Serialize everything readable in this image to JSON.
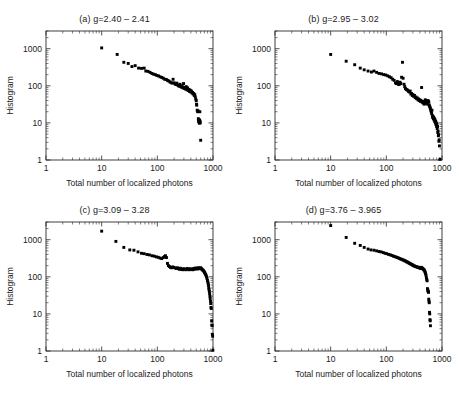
{
  "figure": {
    "cut_top_text": "",
    "background": "#ffffff",
    "marker_color": "#000000",
    "axis_color": "#2b2b2b"
  },
  "common": {
    "xlabel": "Total number of localized photons",
    "ylabel": "Histogram",
    "xticks": [
      "1",
      "10",
      "100",
      "1000"
    ],
    "yticks": [
      "1",
      "10",
      "100",
      "1000"
    ],
    "xlim": [
      1,
      1000
    ],
    "ylim": [
      1,
      3000
    ]
  },
  "chart_data": [
    {
      "type": "scatter",
      "panel": "a",
      "title": "(a)  g=2.40 – 2.41",
      "title_prefix": "(a)",
      "g_range": "2.40 – 2.41",
      "xlabel": "Total number of localized photons",
      "ylabel": "Histogram",
      "xscale": "log",
      "yscale": "log",
      "xlim": [
        1,
        1000
      ],
      "ylim": [
        1,
        3000
      ],
      "xticks": [
        1,
        10,
        100,
        1000
      ],
      "yticks": [
        1,
        10,
        100,
        1000
      ],
      "grid": false,
      "legend": "none",
      "points": [
        [
          10,
          1050
        ],
        [
          19,
          700
        ],
        [
          25,
          430
        ],
        [
          30,
          400
        ],
        [
          35,
          330
        ],
        [
          40,
          350
        ],
        [
          46,
          300
        ],
        [
          52,
          295
        ],
        [
          58,
          300
        ],
        [
          62,
          250
        ],
        [
          68,
          245
        ],
        [
          74,
          230
        ],
        [
          80,
          215
        ],
        [
          86,
          205
        ],
        [
          92,
          200
        ],
        [
          98,
          190
        ],
        [
          105,
          185
        ],
        [
          112,
          175
        ],
        [
          120,
          168
        ],
        [
          128,
          160
        ],
        [
          136,
          150
        ],
        [
          145,
          148
        ],
        [
          152,
          140
        ],
        [
          160,
          135
        ],
        [
          168,
          128
        ],
        [
          176,
          122
        ],
        [
          184,
          118
        ],
        [
          192,
          150
        ],
        [
          200,
          120
        ],
        [
          208,
          112
        ],
        [
          216,
          108
        ],
        [
          224,
          118
        ],
        [
          232,
          105
        ],
        [
          240,
          100
        ],
        [
          248,
          98
        ],
        [
          256,
          110
        ],
        [
          264,
          95
        ],
        [
          272,
          92
        ],
        [
          280,
          100
        ],
        [
          288,
          88
        ],
        [
          296,
          115
        ],
        [
          304,
          85
        ],
        [
          312,
          90
        ],
        [
          320,
          82
        ],
        [
          330,
          95
        ],
        [
          340,
          78
        ],
        [
          350,
          88
        ],
        [
          360,
          75
        ],
        [
          370,
          80
        ],
        [
          380,
          70
        ],
        [
          390,
          76
        ],
        [
          400,
          68
        ],
        [
          410,
          72
        ],
        [
          420,
          64
        ],
        [
          430,
          66
        ],
        [
          440,
          60
        ],
        [
          450,
          62
        ],
        [
          460,
          55
        ],
        [
          470,
          58
        ],
        [
          480,
          50
        ],
        [
          490,
          44
        ],
        [
          500,
          40
        ],
        [
          505,
          32
        ],
        [
          510,
          30
        ],
        [
          520,
          22
        ],
        [
          530,
          20
        ],
        [
          540,
          21
        ],
        [
          545,
          13
        ],
        [
          550,
          12
        ],
        [
          555,
          11
        ],
        [
          560,
          11
        ],
        [
          565,
          10
        ],
        [
          570,
          10
        ],
        [
          575,
          12
        ],
        [
          580,
          20
        ],
        [
          585,
          11
        ],
        [
          590,
          10
        ],
        [
          600,
          3.4
        ]
      ]
    },
    {
      "type": "scatter",
      "panel": "b",
      "title": "(b) g=2.95 – 3.02",
      "title_prefix": "(b)",
      "g_range": "2.95 – 3.02",
      "xlabel": "Total number of localized photons",
      "ylabel": "Histogram",
      "xscale": "log",
      "yscale": "log",
      "xlim": [
        1,
        1000
      ],
      "ylim": [
        1,
        3000
      ],
      "xticks": [
        1,
        10,
        100,
        1000
      ],
      "yticks": [
        1,
        10,
        100,
        1000
      ],
      "grid": false,
      "legend": "none",
      "points": [
        [
          10,
          700
        ],
        [
          19,
          460
        ],
        [
          27,
          370
        ],
        [
          34,
          300
        ],
        [
          40,
          270
        ],
        [
          47,
          250
        ],
        [
          54,
          235
        ],
        [
          60,
          250
        ],
        [
          67,
          230
        ],
        [
          74,
          215
        ],
        [
          82,
          210
        ],
        [
          90,
          200
        ],
        [
          98,
          195
        ],
        [
          106,
          185
        ],
        [
          114,
          175
        ],
        [
          122,
          165
        ],
        [
          130,
          150
        ],
        [
          138,
          140
        ],
        [
          146,
          120
        ],
        [
          152,
          115
        ],
        [
          158,
          130
        ],
        [
          164,
          110
        ],
        [
          170,
          108
        ],
        [
          176,
          125
        ],
        [
          182,
          115
        ],
        [
          188,
          170
        ],
        [
          195,
          430
        ],
        [
          200,
          160
        ],
        [
          208,
          110
        ],
        [
          214,
          95
        ],
        [
          220,
          85
        ],
        [
          228,
          80
        ],
        [
          236,
          78
        ],
        [
          244,
          75
        ],
        [
          252,
          70
        ],
        [
          260,
          68
        ],
        [
          268,
          72
        ],
        [
          276,
          60
        ],
        [
          284,
          62
        ],
        [
          292,
          55
        ],
        [
          300,
          58
        ],
        [
          310,
          52
        ],
        [
          320,
          55
        ],
        [
          330,
          48
        ],
        [
          340,
          50
        ],
        [
          350,
          45
        ],
        [
          360,
          47
        ],
        [
          370,
          42
        ],
        [
          380,
          44
        ],
        [
          390,
          40
        ],
        [
          400,
          42
        ],
        [
          410,
          38
        ],
        [
          420,
          40
        ],
        [
          430,
          90
        ],
        [
          440,
          36
        ],
        [
          450,
          38
        ],
        [
          460,
          34
        ],
        [
          470,
          36
        ],
        [
          480,
          32
        ],
        [
          490,
          34
        ],
        [
          500,
          42
        ],
        [
          510,
          40
        ],
        [
          520,
          38
        ],
        [
          530,
          36
        ],
        [
          540,
          34
        ],
        [
          550,
          32
        ],
        [
          560,
          40
        ],
        [
          570,
          38
        ],
        [
          580,
          36
        ],
        [
          590,
          30
        ],
        [
          600,
          28
        ],
        [
          610,
          26
        ],
        [
          620,
          24
        ],
        [
          630,
          22
        ],
        [
          640,
          20
        ],
        [
          650,
          18
        ],
        [
          660,
          22
        ],
        [
          670,
          16
        ],
        [
          680,
          14
        ],
        [
          690,
          15
        ],
        [
          700,
          13
        ],
        [
          710,
          14
        ],
        [
          720,
          12
        ],
        [
          730,
          13
        ],
        [
          740,
          11
        ],
        [
          750,
          12
        ],
        [
          760,
          10
        ],
        [
          770,
          11
        ],
        [
          780,
          9
        ],
        [
          790,
          10
        ],
        [
          800,
          8
        ],
        [
          810,
          9
        ],
        [
          820,
          7
        ],
        [
          830,
          8
        ],
        [
          840,
          5.5
        ],
        [
          850,
          6
        ],
        [
          860,
          4.5
        ],
        [
          870,
          4.8
        ],
        [
          880,
          3.2
        ],
        [
          890,
          3.5
        ],
        [
          900,
          2.4
        ],
        [
          920,
          1.05
        ]
      ]
    },
    {
      "type": "scatter",
      "panel": "c",
      "title": "(c) g=3.09 – 3.28",
      "title_prefix": "(c)",
      "g_range": "3.09 – 3.28",
      "xlabel": "Total number of localized photons",
      "ylabel": "Histogram",
      "xscale": "log",
      "yscale": "log",
      "xlim": [
        1,
        1000
      ],
      "ylim": [
        1,
        3000
      ],
      "xticks": [
        1,
        10,
        100,
        1000
      ],
      "yticks": [
        1,
        10,
        100,
        1000
      ],
      "grid": false,
      "legend": "none",
      "points": [
        [
          10,
          1700
        ],
        [
          18,
          900
        ],
        [
          25,
          620
        ],
        [
          32,
          530
        ],
        [
          38,
          520
        ],
        [
          45,
          470
        ],
        [
          52,
          430
        ],
        [
          58,
          420
        ],
        [
          65,
          400
        ],
        [
          72,
          390
        ],
        [
          80,
          370
        ],
        [
          88,
          360
        ],
        [
          96,
          345
        ],
        [
          104,
          335
        ],
        [
          112,
          320
        ],
        [
          120,
          310
        ],
        [
          128,
          330
        ],
        [
          134,
          350
        ],
        [
          140,
          370
        ],
        [
          146,
          330
        ],
        [
          152,
          230
        ],
        [
          158,
          200
        ],
        [
          165,
          190
        ],
        [
          172,
          180
        ],
        [
          180,
          175
        ],
        [
          190,
          185
        ],
        [
          200,
          178
        ],
        [
          210,
          172
        ],
        [
          220,
          168
        ],
        [
          230,
          175
        ],
        [
          240,
          165
        ],
        [
          250,
          160
        ],
        [
          260,
          170
        ],
        [
          270,
          158
        ],
        [
          280,
          162
        ],
        [
          290,
          155
        ],
        [
          300,
          165
        ],
        [
          315,
          160
        ],
        [
          330,
          155
        ],
        [
          345,
          168
        ],
        [
          360,
          160
        ],
        [
          375,
          155
        ],
        [
          390,
          165
        ],
        [
          405,
          158
        ],
        [
          420,
          162
        ],
        [
          435,
          155
        ],
        [
          450,
          168
        ],
        [
          465,
          160
        ],
        [
          480,
          172
        ],
        [
          495,
          165
        ],
        [
          510,
          170
        ],
        [
          525,
          162
        ],
        [
          540,
          175
        ],
        [
          555,
          168
        ],
        [
          570,
          172
        ],
        [
          585,
          165
        ],
        [
          600,
          175
        ],
        [
          615,
          168
        ],
        [
          630,
          160
        ],
        [
          645,
          155
        ],
        [
          660,
          150
        ],
        [
          675,
          145
        ],
        [
          690,
          140
        ],
        [
          705,
          130
        ],
        [
          720,
          125
        ],
        [
          735,
          115
        ],
        [
          750,
          110
        ],
        [
          765,
          100
        ],
        [
          780,
          90
        ],
        [
          795,
          80
        ],
        [
          810,
          72
        ],
        [
          820,
          65
        ],
        [
          830,
          58
        ],
        [
          840,
          50
        ],
        [
          850,
          45
        ],
        [
          860,
          40
        ],
        [
          870,
          35
        ],
        [
          880,
          30
        ],
        [
          890,
          26
        ],
        [
          900,
          22
        ],
        [
          910,
          19
        ],
        [
          920,
          15
        ],
        [
          930,
          14
        ],
        [
          945,
          6.5
        ],
        [
          955,
          5
        ],
        [
          965,
          4.8
        ],
        [
          975,
          2.8
        ],
        [
          985,
          2.5
        ],
        [
          995,
          1.05
        ]
      ]
    },
    {
      "type": "scatter",
      "panel": "d",
      "title": "(d) g=3.76 – 3.965",
      "title_prefix": "(d)",
      "g_range": "3.76 – 3.965",
      "xlabel": "Total number of localized photons",
      "ylabel": "Histogram",
      "xscale": "log",
      "yscale": "log",
      "xlim": [
        1,
        1000
      ],
      "ylim": [
        1,
        3000
      ],
      "xticks": [
        1,
        10,
        100,
        1000
      ],
      "yticks": [
        1,
        10,
        100,
        1000
      ],
      "grid": false,
      "legend": "none",
      "points": [
        [
          10,
          2400
        ],
        [
          19,
          1150
        ],
        [
          27,
          800
        ],
        [
          34,
          700
        ],
        [
          40,
          620
        ],
        [
          47,
          560
        ],
        [
          53,
          530
        ],
        [
          60,
          520
        ],
        [
          67,
          500
        ],
        [
          74,
          480
        ],
        [
          80,
          470
        ],
        [
          88,
          450
        ],
        [
          95,
          430
        ],
        [
          102,
          420
        ],
        [
          110,
          400
        ],
        [
          118,
          390
        ],
        [
          126,
          375
        ],
        [
          134,
          360
        ],
        [
          142,
          350
        ],
        [
          150,
          340
        ],
        [
          158,
          330
        ],
        [
          166,
          320
        ],
        [
          174,
          310
        ],
        [
          182,
          300
        ],
        [
          190,
          295
        ],
        [
          198,
          285
        ],
        [
          206,
          280
        ],
        [
          214,
          270
        ],
        [
          222,
          265
        ],
        [
          230,
          255
        ],
        [
          238,
          250
        ],
        [
          246,
          245
        ],
        [
          254,
          235
        ],
        [
          262,
          230
        ],
        [
          270,
          225
        ],
        [
          278,
          218
        ],
        [
          286,
          215
        ],
        [
          294,
          208
        ],
        [
          302,
          205
        ],
        [
          312,
          198
        ],
        [
          322,
          195
        ],
        [
          332,
          190
        ],
        [
          342,
          188
        ],
        [
          352,
          185
        ],
        [
          362,
          182
        ],
        [
          372,
          180
        ],
        [
          382,
          178
        ],
        [
          392,
          175
        ],
        [
          402,
          172
        ],
        [
          412,
          170
        ],
        [
          422,
          180
        ],
        [
          432,
          175
        ],
        [
          442,
          170
        ],
        [
          452,
          165
        ],
        [
          462,
          160
        ],
        [
          472,
          155
        ],
        [
          482,
          150
        ],
        [
          492,
          140
        ],
        [
          500,
          130
        ],
        [
          508,
          120
        ],
        [
          516,
          110
        ],
        [
          524,
          95
        ],
        [
          532,
          85
        ],
        [
          540,
          78
        ],
        [
          548,
          48
        ],
        [
          554,
          45
        ],
        [
          560,
          42
        ],
        [
          566,
          40
        ],
        [
          572,
          38
        ],
        [
          578,
          25
        ],
        [
          584,
          22
        ],
        [
          590,
          20
        ],
        [
          596,
          11
        ],
        [
          602,
          10
        ],
        [
          608,
          7
        ],
        [
          614,
          6.5
        ],
        [
          620,
          4.8
        ]
      ]
    }
  ]
}
